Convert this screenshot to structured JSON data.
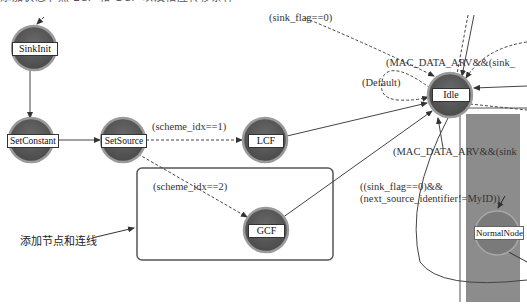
{
  "diagram": {
    "type": "state-transition process model",
    "top_strip_text": "添加状态节点 LCF 和 GCF 以及相应转移条件",
    "nodes": [
      {
        "id": "sinkinit",
        "label": "SinkInit"
      },
      {
        "id": "setconstant",
        "label": "SetConstant"
      },
      {
        "id": "setsource",
        "label": "SetSource"
      },
      {
        "id": "lcf",
        "label": "LCF"
      },
      {
        "id": "gcf",
        "label": "GCF"
      },
      {
        "id": "idle",
        "label": "Idle"
      },
      {
        "id": "normalnode",
        "label": "NormalNode"
      }
    ],
    "transitions": [
      {
        "from": "SinkInit",
        "to": "SetConstant",
        "style": "solid",
        "condition": ""
      },
      {
        "from": "SetConstant",
        "to": "SetSource",
        "style": "solid",
        "condition": ""
      },
      {
        "from": "SetSource",
        "to": "LCF",
        "style": "dashed",
        "condition": "(scheme_idx==1)"
      },
      {
        "from": "SetSource",
        "to": "GCF",
        "style": "dashed",
        "condition": "(scheme_idx==2)"
      },
      {
        "from": "LCF",
        "to": "Idle",
        "style": "solid",
        "condition": ""
      },
      {
        "from": "GCF",
        "to": "Idle",
        "style": "solid",
        "condition": ""
      },
      {
        "from": "?",
        "to": "Idle",
        "style": "dashed",
        "condition": "(sink_flag==0)"
      },
      {
        "from": "Idle",
        "to": "Idle",
        "style": "dashed",
        "condition": "(Default)"
      },
      {
        "from": "?",
        "to": "Idle",
        "style": "dashed",
        "condition": "(MAC_DATA_ARV&&(sink_"
      },
      {
        "from": "?",
        "to": "Idle",
        "style": "solid",
        "condition": "(MAC_DATA_ARV&&(sink"
      },
      {
        "from": "Idle",
        "to": "NormalNode",
        "style": "solid",
        "condition": "((sink_flag==0)&& (next_source_identifier!=MyID))"
      }
    ],
    "labels": {
      "sink_flag": "(sink_flag==0)",
      "mac_top": "(MAC_DATA_ARV&&(sink_",
      "default": "(Default)",
      "scheme1": "(scheme_idx==1)",
      "scheme2": "(scheme_idx==2)",
      "mac_mid": "(MAC_DATA_ARV&&(sink",
      "next_line1": "((sink_flag==0)&&",
      "next_line2": "(next_source_identifier!=MyID))"
    },
    "annotation": {
      "text": "添加节点和连线",
      "target": "new-nodes-box"
    },
    "colors": {
      "node_fill": "#585858",
      "node_ring": "#9a9a9a",
      "panel_gray": "#8c8c8c",
      "line": "#444444",
      "box_border": "#555555"
    }
  }
}
